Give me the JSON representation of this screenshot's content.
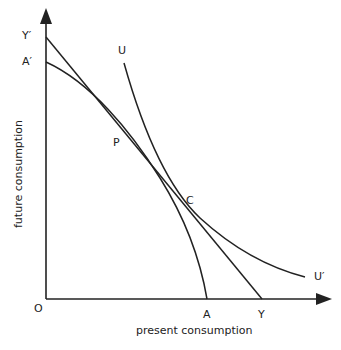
{
  "diagram": {
    "type": "economics-intertemporal-choice",
    "x_axis_label": "present consumption",
    "y_axis_label": "future consumption",
    "origin_label": "O",
    "points": {
      "Y_prime": {
        "label": "Y′"
      },
      "A_prime": {
        "label": "A′"
      },
      "A": {
        "label": "A"
      },
      "Y": {
        "label": "Y"
      },
      "P": {
        "label": "P"
      },
      "C": {
        "label": "C"
      },
      "U": {
        "label": "U"
      },
      "U_prime": {
        "label": "U′"
      }
    },
    "curves": [
      {
        "name": "budget-line",
        "from": "Y′",
        "to": "Y",
        "kind": "straight line"
      },
      {
        "name": "production-possibility-curve",
        "from": "A′",
        "to": "A",
        "kind": "concave curve",
        "tangent_at": "P"
      },
      {
        "name": "indifference-curve",
        "from": "U",
        "to": "U′",
        "kind": "convex curve",
        "tangent_at": "C"
      }
    ],
    "colors": {
      "line": "#222222",
      "background": "#ffffff"
    }
  }
}
